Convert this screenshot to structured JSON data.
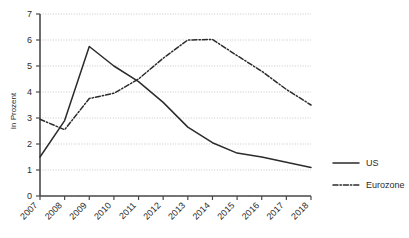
{
  "chart_data": {
    "type": "line",
    "title": "",
    "xlabel": "",
    "ylabel": "In Prozent",
    "x": [
      2007,
      2008,
      2009,
      2010,
      2011,
      2012,
      2013,
      2014,
      2015,
      2016,
      2017,
      2018
    ],
    "xtick_labels": [
      "2007",
      "2008",
      "2009",
      "2010",
      "2011",
      "2012",
      "2013",
      "2014",
      "2015",
      "2016",
      "2017",
      "2018"
    ],
    "ytick_labels": [
      "0",
      "1",
      "2",
      "3",
      "4",
      "5",
      "6",
      "7"
    ],
    "yticks": [
      0,
      1,
      2,
      3,
      4,
      5,
      6,
      7
    ],
    "ylim": [
      0,
      7
    ],
    "xlim": [
      2007,
      2018
    ],
    "grid": true,
    "grid_axis": "y",
    "grid_style": "dotted",
    "legend_position": "right",
    "series": [
      {
        "name": "US",
        "style": "solid",
        "color": "#2b2b2b",
        "values": [
          1.5,
          2.9,
          5.75,
          5.0,
          4.4,
          3.6,
          2.65,
          2.05,
          1.65,
          1.5,
          1.3,
          1.1
        ]
      },
      {
        "name": "Eurozone",
        "style": "dash-dot",
        "color": "#2b2b2b",
        "values": [
          2.95,
          2.55,
          3.75,
          3.95,
          4.5,
          5.3,
          6.0,
          6.02,
          5.4,
          4.8,
          4.1,
          3.5
        ]
      }
    ]
  },
  "legend": {
    "items": [
      {
        "label": "US",
        "style": "solid"
      },
      {
        "label": "Eurozone",
        "style": "dash-dot"
      }
    ]
  },
  "axis": {
    "y_title": "In Prozent"
  }
}
